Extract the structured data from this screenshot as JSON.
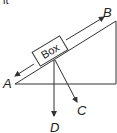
{
  "header": {
    "partial_text": "it"
  },
  "diagram": {
    "type": "inclined-plane-free-body",
    "box_label": "Box",
    "arrows": [
      {
        "label": "A",
        "direction": "down-slope"
      },
      {
        "label": "B",
        "direction": "up-slope"
      },
      {
        "label": "C",
        "direction": "perpendicular-into-slope"
      },
      {
        "label": "D",
        "direction": "straight-down"
      }
    ],
    "colors": {
      "line": "#333333",
      "background": "#ffffff"
    }
  }
}
